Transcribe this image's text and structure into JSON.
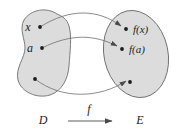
{
  "figure": {
    "background_color": "#ffffff",
    "blob_fill_color": "#dcdcdc",
    "blob_stroke_color": "#6e6e6e",
    "curve_color": "#6e6e6e",
    "dot_color": "#1c1c1c",
    "label_color": "#1c1c1c"
  },
  "domain": {
    "set_label": "D",
    "shape": "kidney-blob",
    "elements": [
      {
        "label": "x",
        "has_label": true
      },
      {
        "label": "a",
        "has_label": true
      },
      {
        "label": "",
        "has_label": false
      }
    ]
  },
  "codomain": {
    "set_label": "E",
    "shape": "ellipse",
    "elements": [
      {
        "label": "f(x)",
        "has_label": true
      },
      {
        "label": "f(a)",
        "has_label": true
      },
      {
        "label": "",
        "has_label": false
      }
    ]
  },
  "mapping": {
    "function_label": "f",
    "arrow_count": 3,
    "arrow_style": "curved-with-arrowhead"
  },
  "bottom_axis": {
    "left_label": "D",
    "function_label": "f",
    "right_label": "E",
    "arrow": "rightwards-arrow"
  }
}
